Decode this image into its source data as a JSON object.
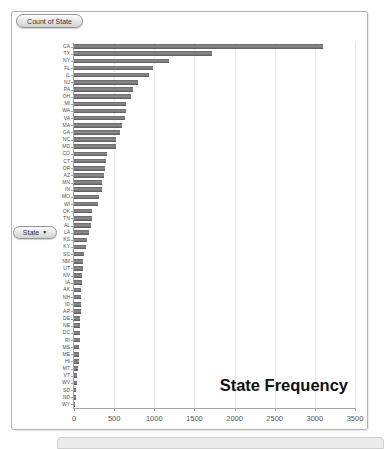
{
  "field_buttons": {
    "value_field": "Count of State",
    "axis_field": "State",
    "dropdown_icon": "▼"
  },
  "chart_data": {
    "type": "bar",
    "orientation": "horizontal",
    "title": "State Frequency",
    "xlabel": "",
    "ylabel": "State",
    "xlim": [
      0,
      3500
    ],
    "x_ticks": [
      0,
      500,
      1000,
      1500,
      2000,
      2500,
      3000,
      3500
    ],
    "grid": true,
    "legend": false,
    "bar_color": "#6a6a6a",
    "categories": [
      "CA",
      "TX",
      "NY",
      "FL",
      "IL",
      "NJ",
      "PA",
      "OH",
      "MI",
      "WA",
      "VA",
      "MA",
      "GA",
      "NC",
      "MD",
      "CO",
      "CT",
      "OR",
      "AZ",
      "MN",
      "IN",
      "MO",
      "WI",
      "OK",
      "TN",
      "AL",
      "LA",
      "KS",
      "KY",
      "SC",
      "NM",
      "UT",
      "NV",
      "IA",
      "AK",
      "NH",
      "ID",
      "AR",
      "DE",
      "NE",
      "DC",
      "RI",
      "MS",
      "ME",
      "HI",
      "MT",
      "VT",
      "WV",
      "SD",
      "ND",
      "WY"
    ],
    "values": [
      3100,
      1725,
      1180,
      990,
      930,
      800,
      740,
      715,
      650,
      645,
      640,
      595,
      570,
      525,
      520,
      410,
      395,
      380,
      375,
      350,
      345,
      315,
      305,
      230,
      220,
      210,
      190,
      165,
      145,
      130,
      118,
      115,
      105,
      95,
      92,
      90,
      85,
      84,
      80,
      78,
      72,
      70,
      64,
      63,
      62,
      46,
      42,
      33,
      29,
      28,
      15
    ]
  }
}
